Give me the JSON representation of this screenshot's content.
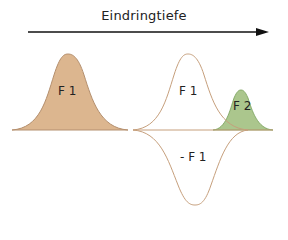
{
  "title": "Eindringtiefe",
  "colors": {
    "f1_fill": "#dcb68f",
    "f1_stroke": "#b48f6e",
    "f2_fill": "#a7c487",
    "f2_stroke": "#6f9a4f",
    "arrow": "#111111"
  },
  "labels": {
    "left_f1": "F 1",
    "right_f1": "F 1",
    "f2": "F 2",
    "neg_f1": "- F 1"
  }
}
